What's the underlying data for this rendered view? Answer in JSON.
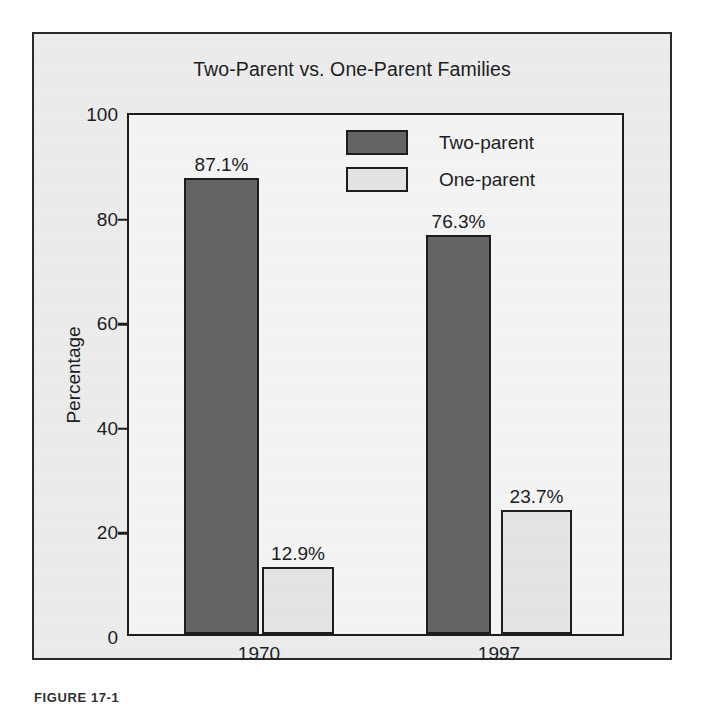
{
  "figure": {
    "caption": "FIGURE   17-1"
  },
  "chart_data": {
    "type": "bar",
    "title": "Two-Parent vs. One-Parent Families",
    "xlabel": "",
    "ylabel": "Percentage",
    "categories": [
      "1970",
      "1997"
    ],
    "ylim": [
      0,
      100
    ],
    "yticks": [
      0,
      20,
      40,
      60,
      80,
      100
    ],
    "ytick_labels": [
      "0",
      "20",
      "40",
      "60",
      "80",
      "100"
    ],
    "grid": false,
    "legend_position": "top-right-inside",
    "series": [
      {
        "name": "Two-parent",
        "color": "#646464",
        "values": [
          87.1,
          76.3
        ],
        "data_labels": [
          "87.1%",
          "76.3%"
        ]
      },
      {
        "name": "One-parent",
        "color": "#e4e4e4",
        "values": [
          12.9,
          23.7
        ],
        "data_labels": [
          "12.9%",
          "23.7%"
        ]
      }
    ]
  }
}
